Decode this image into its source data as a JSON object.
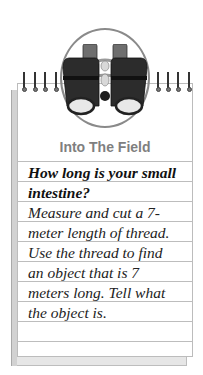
{
  "card": {
    "icon": "binoculars-icon",
    "title": "Into The Field",
    "question_lines": [
      "How long is your small",
      "intestine?"
    ],
    "body_lines": [
      "Measure and cut a 7-",
      "meter length of thread.",
      "Use the thread to find",
      "an object that is 7",
      "meters long. Tell what",
      "the object is."
    ],
    "colors": {
      "title": "#7f7f7f",
      "rule": "#bdbdbd",
      "paper_shadow": "#d2d2d2"
    }
  }
}
